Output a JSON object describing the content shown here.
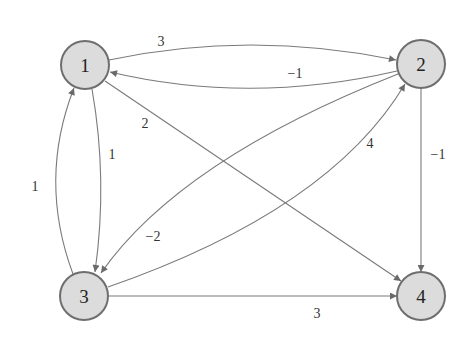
{
  "diagram": {
    "type": "directed-weighted-graph",
    "colors": {
      "node_fill": "#dcdcdc",
      "node_stroke": "#6e6e6e",
      "edge": "#7a7a7a",
      "text": "#222222"
    },
    "nodes": [
      {
        "id": "1",
        "label": "1",
        "x": 85,
        "y": 65
      },
      {
        "id": "2",
        "label": "2",
        "x": 421,
        "y": 64
      },
      {
        "id": "3",
        "label": "3",
        "x": 84,
        "y": 296
      },
      {
        "id": "4",
        "label": "4",
        "x": 421,
        "y": 296
      }
    ],
    "edges": [
      {
        "from": "1",
        "to": "2",
        "weight": "3"
      },
      {
        "from": "2",
        "to": "1",
        "weight": "−1"
      },
      {
        "from": "1",
        "to": "3",
        "weight": "1"
      },
      {
        "from": "3",
        "to": "1",
        "weight": "1"
      },
      {
        "from": "1",
        "to": "4",
        "weight": "2"
      },
      {
        "from": "2",
        "to": "3",
        "weight": "−2"
      },
      {
        "from": "3",
        "to": "2",
        "weight": "4"
      },
      {
        "from": "2",
        "to": "4",
        "weight": "−1"
      },
      {
        "from": "3",
        "to": "4",
        "weight": "3"
      }
    ]
  }
}
